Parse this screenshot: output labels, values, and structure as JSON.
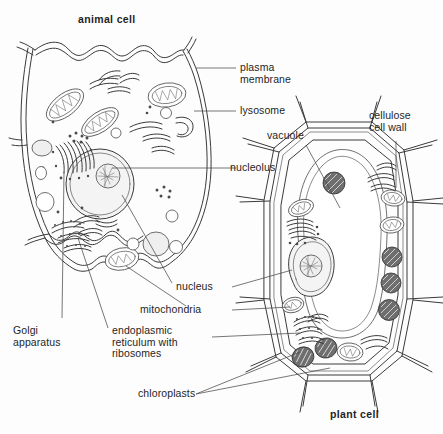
{
  "figure": {
    "kind": "biology-diagram",
    "background_color": "#fdfdfd",
    "ink_color": "#3a3a3a",
    "chloroplast_color": "#6e6e6e"
  },
  "titles": {
    "animal": "animal cell",
    "plant": "plant cell"
  },
  "labels": {
    "plasma_membrane": "plasma\nmembrane",
    "lysosome": "lysosome",
    "vacuole": "vacuole",
    "cellulose_cell_wall": "cellulose\ncell wall",
    "nucleolus": "nucleolus",
    "nucleus": "nucleus",
    "mitochondria": "mitochondria",
    "golgi_apparatus": "Golgi\napparatus",
    "endoplasmic_reticulum": "endoplasmic\nreticulum with\nribosomes",
    "chloroplasts": "chloroplasts"
  },
  "structures": {
    "animal_cell": [
      "plasma membrane",
      "nucleus",
      "nucleolus",
      "mitochondria",
      "lysosome",
      "Golgi apparatus",
      "endoplasmic reticulum with ribosomes",
      "vacuoles"
    ],
    "plant_cell": [
      "cellulose cell wall",
      "plasma membrane",
      "vacuole",
      "nucleus",
      "nucleolus",
      "mitochondria",
      "chloroplasts",
      "Golgi apparatus",
      "endoplasmic reticulum with ribosomes"
    ]
  }
}
